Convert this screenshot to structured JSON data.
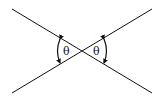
{
  "diagram": {
    "title": "",
    "elements": {
      "line_a": {
        "x1": 12,
        "y1": 9,
        "x2": 152,
        "y2": 93
      },
      "line_b": {
        "x1": 12,
        "y1": 93,
        "x2": 152,
        "y2": 9
      },
      "intersection": {
        "x": 82,
        "y": 51
      }
    },
    "labels": {
      "left_angle": "θ",
      "right_angle": "θ"
    },
    "colors": {
      "line": "#111111",
      "background": "#ffffff"
    }
  }
}
